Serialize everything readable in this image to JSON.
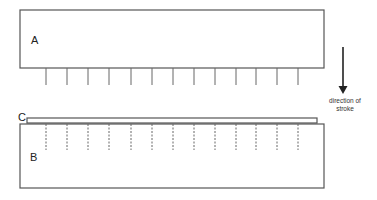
{
  "diagram": {
    "colors": {
      "line": "#555555",
      "text": "#222222",
      "background": "#ffffff"
    },
    "box_a": {
      "label": "A",
      "x": 20,
      "y": 10,
      "width": 304,
      "height": 58
    },
    "box_b": {
      "label": "B",
      "x": 20,
      "y": 124,
      "width": 304,
      "height": 64
    },
    "strip_c": {
      "label": "C",
      "x": 27,
      "y": 118,
      "width": 290,
      "height": 5
    },
    "teeth_solid": {
      "x_positions": [
        46,
        67,
        88,
        109,
        131,
        152,
        173,
        194,
        215,
        236,
        256,
        277,
        298
      ],
      "y_start": 68,
      "y_end": 85
    },
    "teeth_dashed": {
      "x_positions": [
        46,
        67,
        88,
        109,
        131,
        152,
        173,
        194,
        215,
        236,
        256,
        277,
        298
      ],
      "y_start": 124,
      "y_end": 150
    },
    "arrow": {
      "x": 343,
      "y_start": 47,
      "y_end": 93
    },
    "caption": {
      "line1": "direction of",
      "line2": "stroke"
    }
  }
}
